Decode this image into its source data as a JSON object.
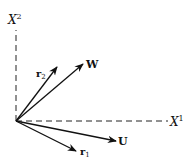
{
  "diagram": {
    "title": "",
    "colors": {
      "ink": "#111111",
      "background": "#ffffff"
    },
    "origin": {
      "x": 16,
      "y": 121
    },
    "axes": [
      {
        "id": "x1",
        "label": "X",
        "superscript": "1",
        "direction": "horizontal",
        "style": "dashed"
      },
      {
        "id": "x2",
        "label": "X",
        "superscript": "2",
        "direction": "vertical",
        "style": "dashed"
      }
    ],
    "vectors": [
      {
        "id": "r2",
        "label": "r",
        "subscript": "2",
        "tip": {
          "x": 57,
          "y": 67
        }
      },
      {
        "id": "w",
        "label": "W",
        "subscript": "",
        "tip": {
          "x": 83,
          "y": 64
        }
      },
      {
        "id": "u",
        "label": "U",
        "subscript": "",
        "tip": {
          "x": 116,
          "y": 141
        }
      },
      {
        "id": "r1",
        "label": "r",
        "subscript": "1",
        "tip": {
          "x": 76,
          "y": 151
        }
      }
    ]
  }
}
